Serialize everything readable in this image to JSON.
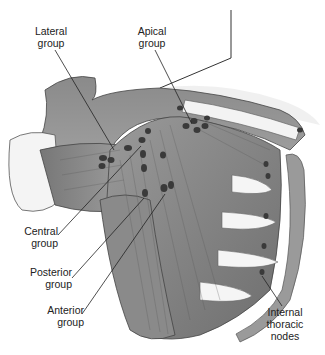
{
  "figure": {
    "labels": {
      "lateral": "Lateral\ngroup",
      "apical": "Apical\ngroup",
      "central": "Central\ngroup",
      "posterior": "Posterior\ngroup",
      "anterior": "Anterior\ngroup",
      "internal_thoracic": "Internal\nthoracic\nnodes"
    },
    "colors": {
      "background": "#ffffff",
      "muscle_dark": "#6b6b6b",
      "muscle_mid": "#8f8f8f",
      "muscle_light": "#b5b5b5",
      "bone": "#f2f2f2",
      "node": "#3a3a3a",
      "leader_line": "#222222"
    }
  }
}
